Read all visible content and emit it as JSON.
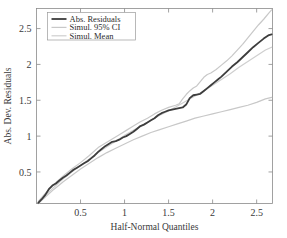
{
  "chart_data": {
    "type": "line",
    "title": "",
    "xlabel": "Half-Normal Quantiles",
    "ylabel": "Abs. Dev. Residuals",
    "xlim": [
      0,
      2.68
    ],
    "ylim": [
      0.06,
      2.78
    ],
    "xticks": [
      0.5,
      1,
      1.5,
      2,
      2.5
    ],
    "xtick_labels": [
      "0.5",
      "1",
      "1.5",
      "2",
      "2.5"
    ],
    "yticks": [
      0.5,
      1,
      1.5,
      2,
      2.5
    ],
    "ytick_labels": [
      "0.5",
      "1",
      "1.5",
      "2",
      "2.5"
    ],
    "grid": false,
    "legend_position": "top-left",
    "series": [
      {
        "name": "Abs. Residuals",
        "color": "#3d3d3d",
        "width": 1.8,
        "x": [
          0.02,
          0.06,
          0.1,
          0.14,
          0.18,
          0.22,
          0.26,
          0.3,
          0.34,
          0.38,
          0.42,
          0.46,
          0.5,
          0.54,
          0.58,
          0.62,
          0.66,
          0.7,
          0.74,
          0.78,
          0.82,
          0.86,
          0.9,
          0.94,
          0.98,
          1.02,
          1.06,
          1.1,
          1.14,
          1.18,
          1.22,
          1.26,
          1.3,
          1.34,
          1.38,
          1.42,
          1.46,
          1.5,
          1.54,
          1.58,
          1.62,
          1.66,
          1.7,
          1.74,
          1.78,
          1.82,
          1.86,
          1.9,
          1.94,
          1.98,
          2.02,
          2.06,
          2.1,
          2.16,
          2.22,
          2.28,
          2.34,
          2.4,
          2.46,
          2.52,
          2.58,
          2.64,
          2.67
        ],
        "y": [
          0.07,
          0.12,
          0.18,
          0.26,
          0.31,
          0.34,
          0.38,
          0.42,
          0.45,
          0.49,
          0.53,
          0.56,
          0.59,
          0.62,
          0.65,
          0.69,
          0.73,
          0.78,
          0.82,
          0.86,
          0.89,
          0.92,
          0.93,
          0.95,
          0.98,
          1.0,
          1.03,
          1.06,
          1.1,
          1.14,
          1.16,
          1.19,
          1.22,
          1.25,
          1.29,
          1.32,
          1.34,
          1.36,
          1.37,
          1.38,
          1.39,
          1.4,
          1.44,
          1.53,
          1.57,
          1.58,
          1.59,
          1.63,
          1.67,
          1.71,
          1.75,
          1.79,
          1.83,
          1.9,
          1.97,
          2.03,
          2.1,
          2.17,
          2.24,
          2.3,
          2.36,
          2.41,
          2.42
        ]
      },
      {
        "name": "Simul. 95% CI Upper",
        "color": "#c8c8c8",
        "width": 1.2,
        "x": [
          0.02,
          0.1,
          0.2,
          0.3,
          0.4,
          0.5,
          0.6,
          0.7,
          0.78,
          0.86,
          0.94,
          1.02,
          1.1,
          1.18,
          1.26,
          1.34,
          1.42,
          1.5,
          1.58,
          1.62,
          1.66,
          1.7,
          1.74,
          1.78,
          1.82,
          1.86,
          1.9,
          1.94,
          1.98,
          2.04,
          2.1,
          2.16,
          2.22,
          2.28,
          2.34,
          2.4,
          2.46,
          2.52,
          2.58,
          2.64,
          2.67
        ],
        "y": [
          0.09,
          0.2,
          0.33,
          0.44,
          0.54,
          0.63,
          0.73,
          0.84,
          0.9,
          0.96,
          1.02,
          1.08,
          1.14,
          1.2,
          1.25,
          1.31,
          1.36,
          1.4,
          1.43,
          1.45,
          1.52,
          1.58,
          1.63,
          1.67,
          1.7,
          1.76,
          1.82,
          1.86,
          1.88,
          1.93,
          1.99,
          2.05,
          2.12,
          2.2,
          2.28,
          2.37,
          2.46,
          2.55,
          2.63,
          2.72,
          2.76
        ]
      },
      {
        "name": "Simul. Mean",
        "color": "#cfcfcf",
        "width": 1.2,
        "x": [
          0.02,
          0.1,
          0.2,
          0.3,
          0.4,
          0.5,
          0.6,
          0.7,
          0.8,
          0.9,
          1.0,
          1.1,
          1.2,
          1.3,
          1.4,
          1.5,
          1.6,
          1.7,
          1.8,
          1.9,
          2.0,
          2.1,
          2.2,
          2.3,
          2.4,
          2.5,
          2.6,
          2.67
        ],
        "y": [
          0.07,
          0.17,
          0.29,
          0.4,
          0.5,
          0.59,
          0.68,
          0.77,
          0.85,
          0.93,
          1.01,
          1.08,
          1.15,
          1.22,
          1.29,
          1.35,
          1.42,
          1.49,
          1.56,
          1.63,
          1.71,
          1.79,
          1.87,
          1.96,
          2.04,
          2.12,
          2.2,
          2.24
        ]
      },
      {
        "name": "Simul. 95% CI Lower",
        "color": "#c8c8c8",
        "width": 1.2,
        "x": [
          0.02,
          0.1,
          0.2,
          0.3,
          0.4,
          0.5,
          0.6,
          0.7,
          0.8,
          0.9,
          1.0,
          1.1,
          1.2,
          1.3,
          1.4,
          1.5,
          1.6,
          1.7,
          1.8,
          1.9,
          2.0,
          2.1,
          2.2,
          2.3,
          2.4,
          2.5,
          2.6,
          2.67
        ],
        "y": [
          0.06,
          0.15,
          0.26,
          0.36,
          0.45,
          0.54,
          0.62,
          0.7,
          0.77,
          0.83,
          0.89,
          0.95,
          1.0,
          1.05,
          1.09,
          1.13,
          1.17,
          1.21,
          1.25,
          1.28,
          1.31,
          1.34,
          1.37,
          1.4,
          1.43,
          1.47,
          1.52,
          1.54
        ]
      }
    ],
    "legend": [
      {
        "label": "Abs. Residuals",
        "color": "#3d3d3d",
        "width": 1.8
      },
      {
        "label": "Simul. 95% CI",
        "color": "#c8c8c8",
        "width": 1.2
      },
      {
        "label": "Simul. Mean",
        "color": "#cfcfcf",
        "width": 1.2
      }
    ],
    "axis_color": "#8a8a8a",
    "background": "#ffffff"
  }
}
